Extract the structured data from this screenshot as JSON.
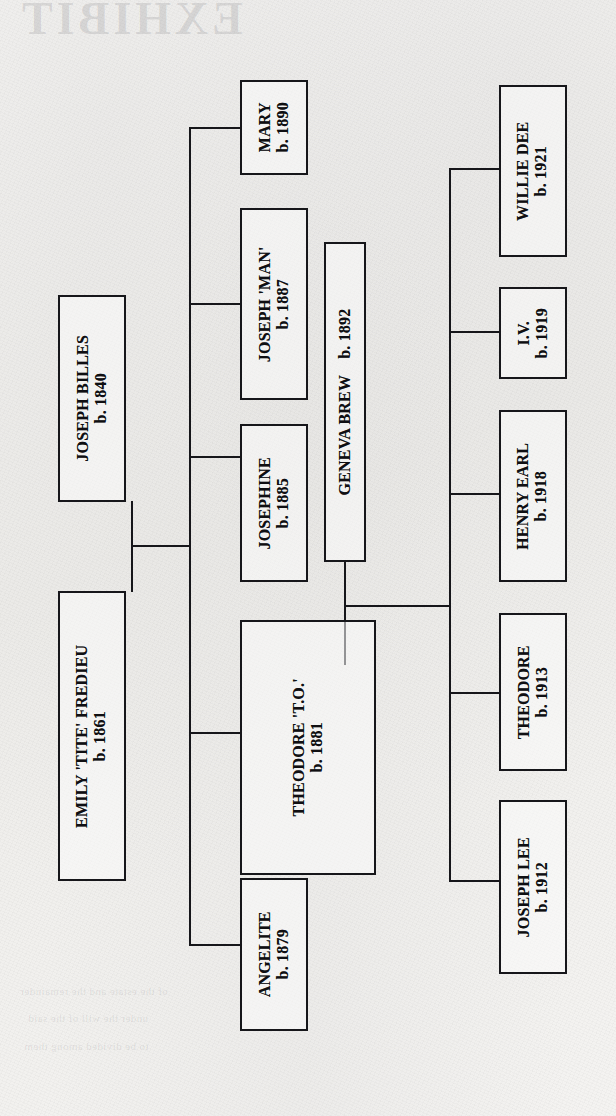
{
  "document": {
    "type": "family-tree-chart",
    "orientation": "rotated-90-counterclockwise",
    "medium": "scanned book page"
  },
  "bleed_through": {
    "title": "EXHIBIT",
    "lines": [
      "of the estate and the remainder",
      "under the will of the said",
      "to be divided among them"
    ]
  },
  "nodes": {
    "joseph_billes": {
      "name": "JOSEPH BILLES",
      "birth": "b. 1840",
      "generation": 1
    },
    "emily_fredieu": {
      "name": "EMILY 'TITE' FREDIEU",
      "birth": "b. 1861",
      "generation": 1
    },
    "mary": {
      "name": "MARY",
      "birth": "b. 1890",
      "generation": 2
    },
    "joseph_man": {
      "name": "JOSEPH 'MAN'",
      "birth": "b. 1887",
      "generation": 2
    },
    "josephine": {
      "name": "JOSEPHINE",
      "birth": "b. 1885",
      "generation": 2
    },
    "theodore_to": {
      "name": "THEODORE 'T.O.'",
      "birth": "b. 1881",
      "generation": 2
    },
    "angelite": {
      "name": "ANGELITE",
      "birth": "b. 1879",
      "generation": 2
    },
    "geneva_brew": {
      "name": "GENEVA BREW",
      "birth": "b. 1892",
      "generation": 2
    },
    "willie_dee": {
      "name": "WILLIE DEE",
      "birth": "b. 1921",
      "generation": 3
    },
    "iv": {
      "name": "I.V.",
      "birth": "b. 1919",
      "generation": 3
    },
    "henry_earl": {
      "name": "HENRY EARL",
      "birth": "b. 1918",
      "generation": 3
    },
    "theodore": {
      "name": "THEODORE",
      "birth": "b. 1913",
      "generation": 3
    },
    "joseph_lee": {
      "name": "JOSEPH LEE",
      "birth": "b. 1912",
      "generation": 3
    }
  },
  "relationships": {
    "marriage_1": {
      "spouses": [
        "JOSEPH BILLES",
        "EMILY 'TITE' FREDIEU"
      ],
      "children": [
        "MARY",
        "JOSEPH 'MAN'",
        "JOSEPHINE",
        "THEODORE 'T.O.'",
        "ANGELITE"
      ]
    },
    "marriage_2": {
      "spouses": [
        "THEODORE 'T.O.'",
        "GENEVA BREW"
      ],
      "children": [
        "WILLIE DEE",
        "I.V.",
        "HENRY EARL",
        "THEODORE",
        "JOSEPH LEE"
      ]
    }
  },
  "colors": {
    "ink": "#16161a",
    "paper": "#f2f1ef"
  }
}
